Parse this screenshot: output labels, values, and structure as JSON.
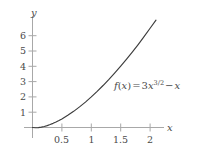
{
  "chart_data": {
    "type": "line",
    "title": "",
    "xlabel": "x",
    "ylabel": "y",
    "function_label": "f(x) = 3x^{3/2} - x",
    "function_parts": {
      "name": "f",
      "arg_open": "(",
      "arg": "x",
      "arg_close": ")",
      "equals": "=",
      "coefficient": "3",
      "base": "x",
      "exponent": "3/2",
      "minus": "−",
      "linear_term": "x"
    },
    "xlim": [
      -0.12,
      2.45
    ],
    "ylim": [
      -0.45,
      6.9
    ],
    "xticks": [
      0.5,
      1,
      1.5,
      2
    ],
    "xtick_labels": [
      "0.5",
      "1",
      "1.5",
      "2"
    ],
    "yticks": [
      1,
      2,
      3,
      4,
      5,
      6
    ],
    "ytick_labels": [
      "1",
      "2",
      "3",
      "4",
      "5",
      "6"
    ],
    "grid": false,
    "legend": "none",
    "curve_color": "#3c3c3c",
    "axis_color": "#a8a8a8",
    "text_color": "#4a4a4a",
    "x": [
      0,
      0.05,
      0.1,
      0.15,
      0.2,
      0.25,
      0.3,
      0.35,
      0.4,
      0.45,
      0.5,
      0.6,
      0.7,
      0.8,
      0.9,
      1,
      1.1,
      1.2,
      1.3,
      1.4,
      1.5,
      1.6,
      1.7,
      1.8,
      1.9,
      2,
      2.1
    ],
    "values": [
      0,
      -0.016,
      -0.005,
      0.024,
      0.068,
      0.125,
      0.193,
      0.271,
      0.359,
      0.456,
      0.561,
      0.794,
      1.056,
      1.347,
      1.662,
      2,
      2.361,
      2.743,
      3.145,
      3.567,
      4.008,
      4.467,
      4.944,
      5.439,
      5.951,
      6.485,
      7.019
    ]
  },
  "axes": {
    "y_axis_name": "y",
    "x_axis_name": "x"
  }
}
